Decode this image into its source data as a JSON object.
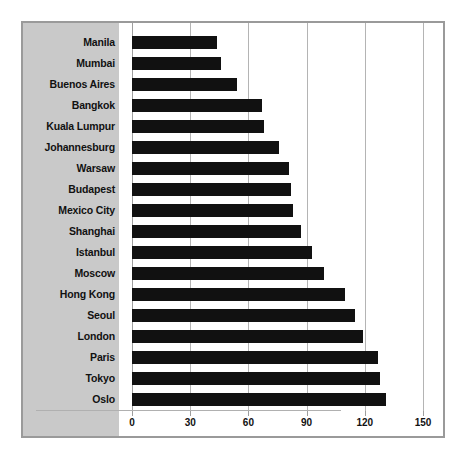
{
  "chart_data": {
    "type": "bar",
    "orientation": "horizontal",
    "title": "",
    "subtitle": "",
    "xlabel": "",
    "ylabel": "",
    "categories": [
      "Manila",
      "Mumbai",
      "Buenos Aires",
      "Bangkok",
      "Kuala Lumpur",
      "Johannesburg",
      "Warsaw",
      "Budapest",
      "Mexico City",
      "Shanghai",
      "Istanbul",
      "Moscow",
      "Hong Kong",
      "Seoul",
      "London",
      "Paris",
      "Tokyo",
      "Oslo"
    ],
    "values": [
      44,
      46,
      54,
      67,
      68,
      76,
      81,
      82,
      83,
      87,
      93,
      99,
      110,
      115,
      119,
      127,
      128,
      131
    ],
    "xlim": [
      0,
      150
    ],
    "xticks": [
      0,
      30,
      60,
      90,
      120,
      150
    ],
    "xtick_labels": [
      "0",
      "30",
      "60",
      "90",
      "120",
      "150"
    ],
    "grid": true,
    "grid_axis": "x",
    "legend": null,
    "bar_color": "#111111",
    "label_band_color": "#c9c9c9",
    "gridline_color": "#b4b4b4",
    "frame_color": "#9a9a9a",
    "background_color": "#ffffff"
  }
}
